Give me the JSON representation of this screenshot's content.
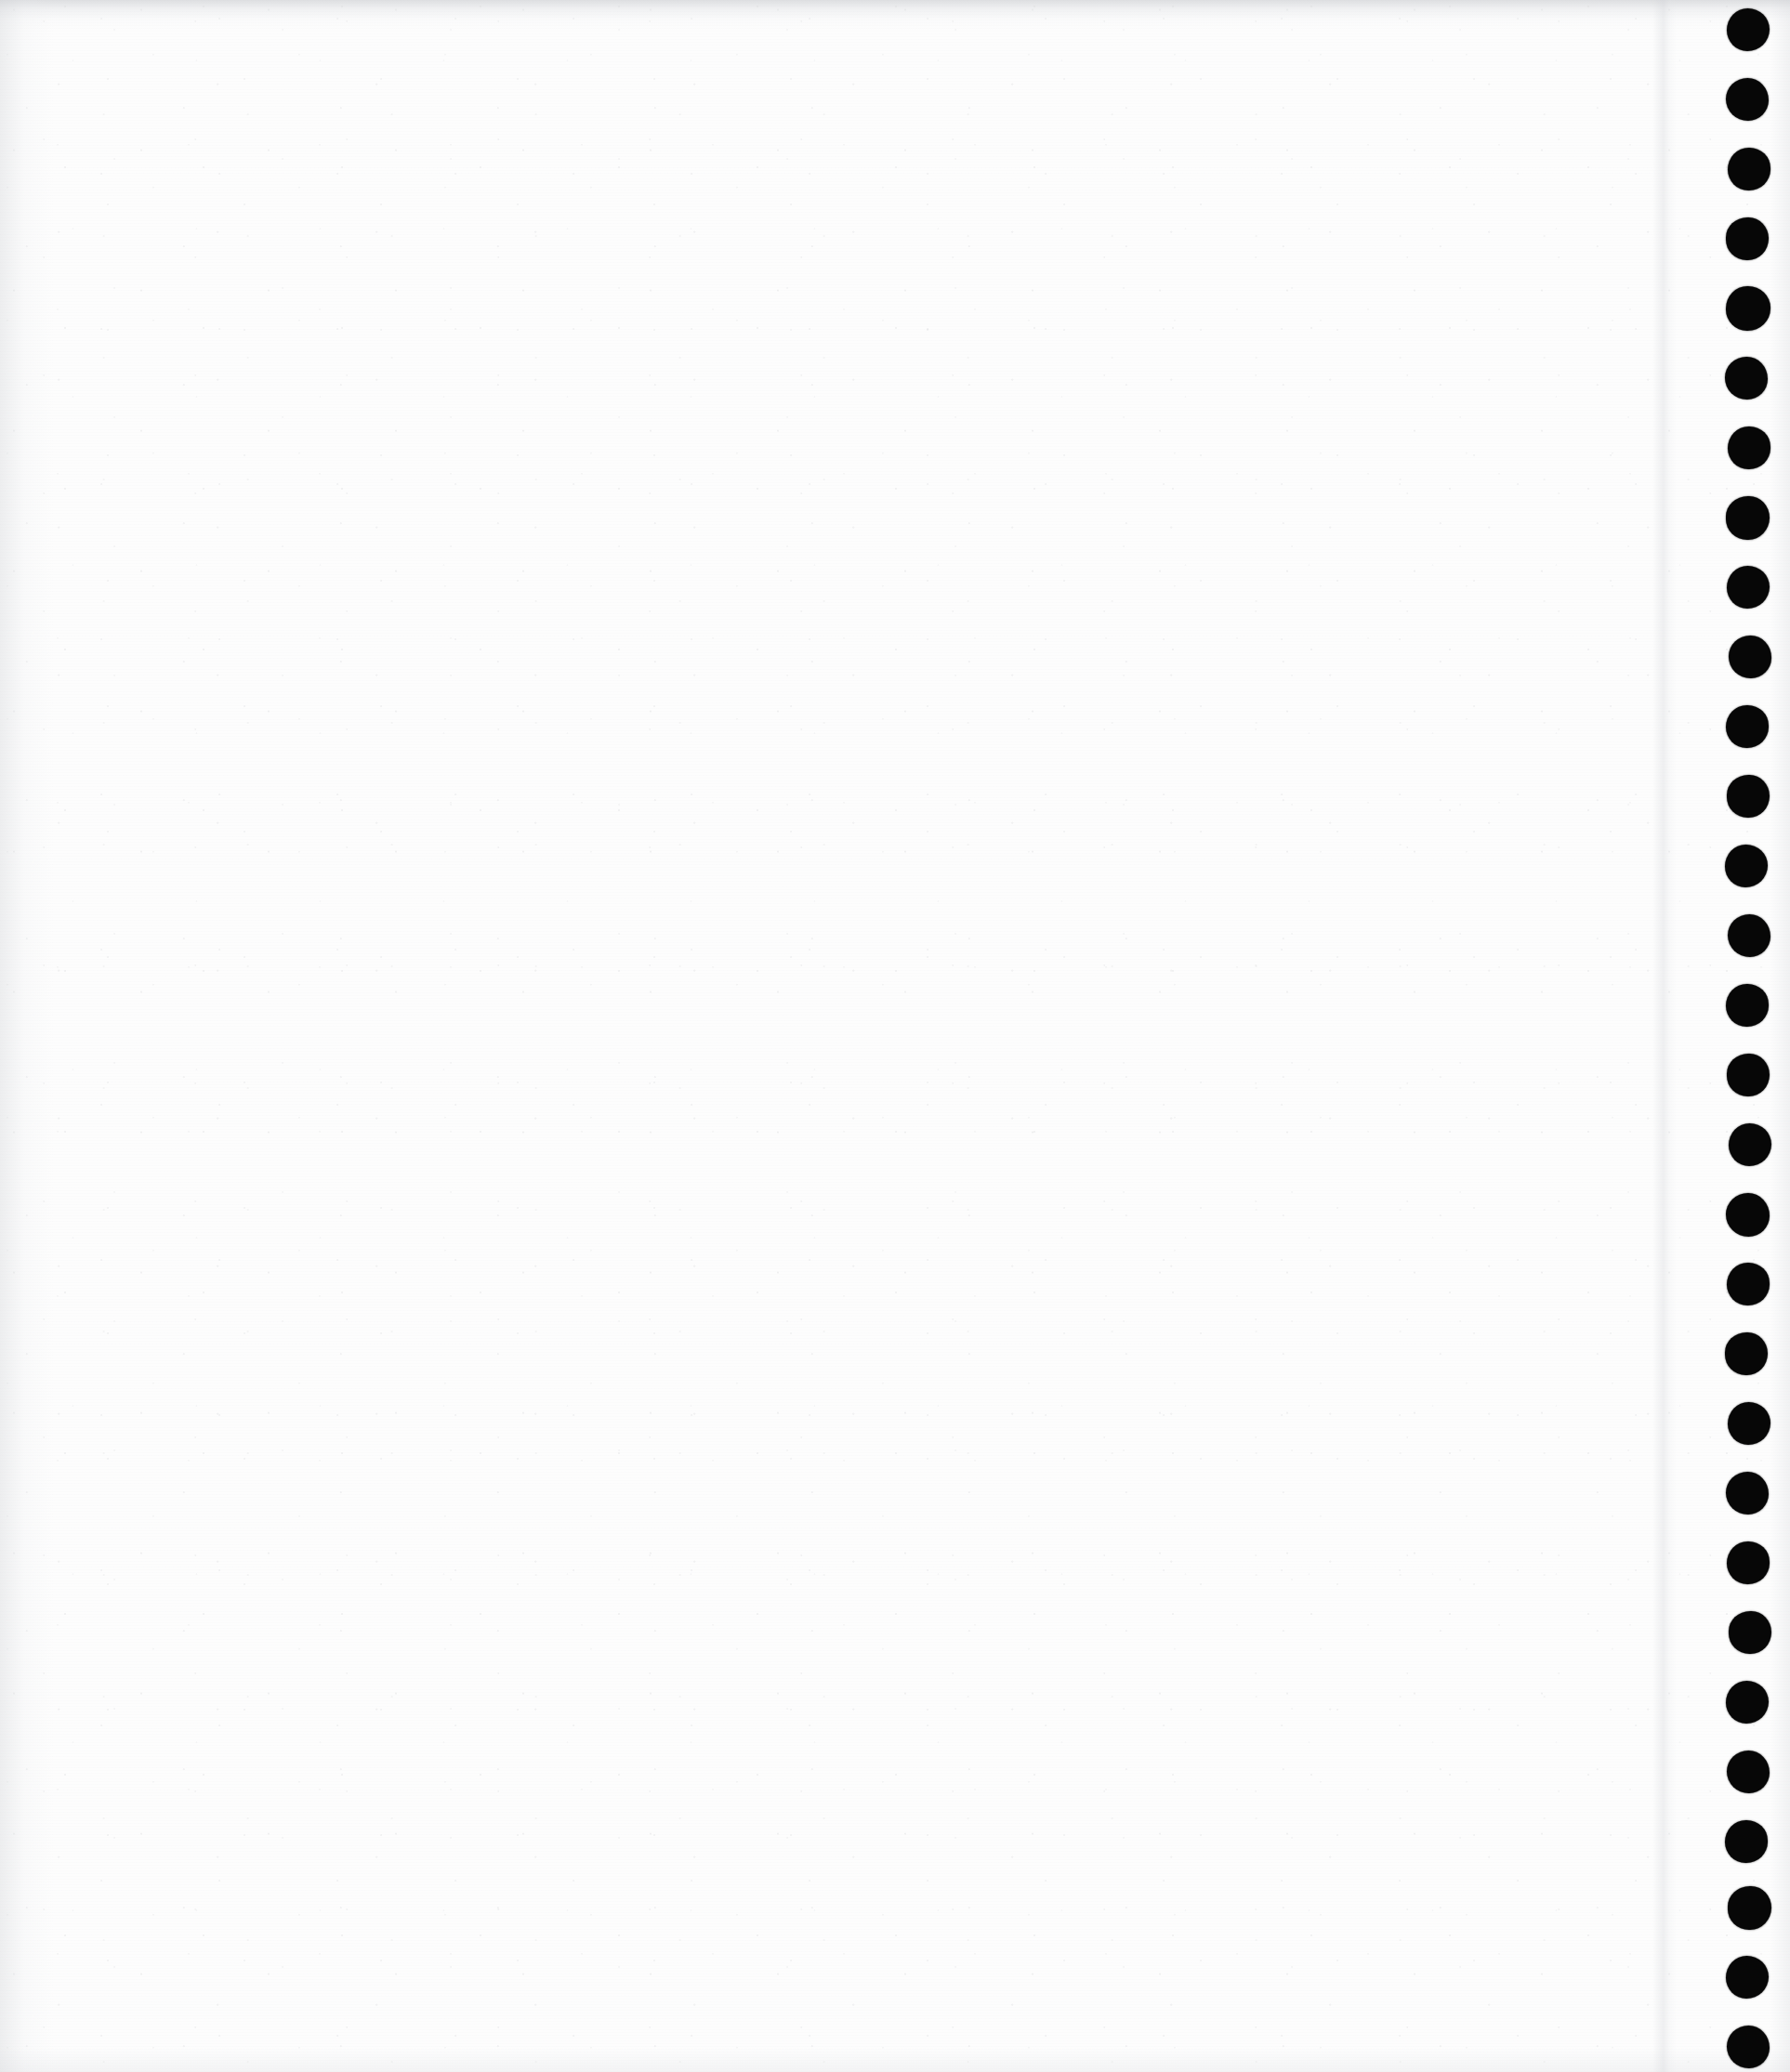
{
  "document": {
    "kind": "scanned-page",
    "title": "Scanned blank notebook page",
    "page_width": 1926,
    "page_height": 2230,
    "orientation": "portrait",
    "content_text": "",
    "body_is_blank": true
  },
  "colors": {
    "paper": "#fdfdfd",
    "paper_white": "#ffffff",
    "hole_fill": "#070707",
    "edge_shadow": "#c4c6ca",
    "grain": "#aaacb0"
  },
  "paper": {
    "grain_opacity": 0.55,
    "scanline_opacity": 0.3,
    "edge_shade_top_height": 34,
    "edge_shade_left_width": 58,
    "edge_shade_bottom_height": 26,
    "edge_shade_right_width": 22
  },
  "crease": {
    "name": "vertical-fold-line",
    "x": 1778,
    "width": 26
  },
  "binding_holes": {
    "label": "spiral-binding punch holes",
    "count": 30,
    "center_x": 1881,
    "radius": 23,
    "first_center_y": 32,
    "spacing_y": 75,
    "holes": [
      {
        "cx": 1881,
        "cy": 32,
        "r": 23.4
      },
      {
        "cx": 1880,
        "cy": 107,
        "r": 23.0
      },
      {
        "cx": 1882,
        "cy": 182,
        "r": 22.6
      },
      {
        "cx": 1880,
        "cy": 257,
        "r": 23.2
      },
      {
        "cx": 1881,
        "cy": 332,
        "r": 23.6
      },
      {
        "cx": 1879,
        "cy": 407,
        "r": 22.8
      },
      {
        "cx": 1882,
        "cy": 482,
        "r": 23.1
      },
      {
        "cx": 1880,
        "cy": 557,
        "r": 23.5
      },
      {
        "cx": 1881,
        "cy": 632,
        "r": 23.0
      },
      {
        "cx": 1883,
        "cy": 707,
        "r": 22.7
      },
      {
        "cx": 1880,
        "cy": 782,
        "r": 23.3
      },
      {
        "cx": 1881,
        "cy": 857,
        "r": 23.0
      },
      {
        "cx": 1879,
        "cy": 932,
        "r": 22.9
      },
      {
        "cx": 1882,
        "cy": 1007,
        "r": 23.4
      },
      {
        "cx": 1880,
        "cy": 1082,
        "r": 23.1
      },
      {
        "cx": 1881,
        "cy": 1157,
        "r": 22.8
      },
      {
        "cx": 1883,
        "cy": 1232,
        "r": 23.2
      },
      {
        "cx": 1880,
        "cy": 1307,
        "r": 23.5
      },
      {
        "cx": 1881,
        "cy": 1382,
        "r": 22.9
      },
      {
        "cx": 1879,
        "cy": 1457,
        "r": 23.0
      },
      {
        "cx": 1882,
        "cy": 1532,
        "r": 23.3
      },
      {
        "cx": 1880,
        "cy": 1607,
        "r": 23.1
      },
      {
        "cx": 1881,
        "cy": 1682,
        "r": 22.7
      },
      {
        "cx": 1883,
        "cy": 1757,
        "r": 23.4
      },
      {
        "cx": 1880,
        "cy": 1832,
        "r": 23.0
      },
      {
        "cx": 1881,
        "cy": 1907,
        "r": 23.2
      },
      {
        "cx": 1879,
        "cy": 1982,
        "r": 22.8
      },
      {
        "cx": 1882,
        "cy": 2053,
        "r": 23.5
      },
      {
        "cx": 1880,
        "cy": 2128,
        "r": 23.1
      },
      {
        "cx": 1881,
        "cy": 2203,
        "r": 23.3
      }
    ]
  }
}
